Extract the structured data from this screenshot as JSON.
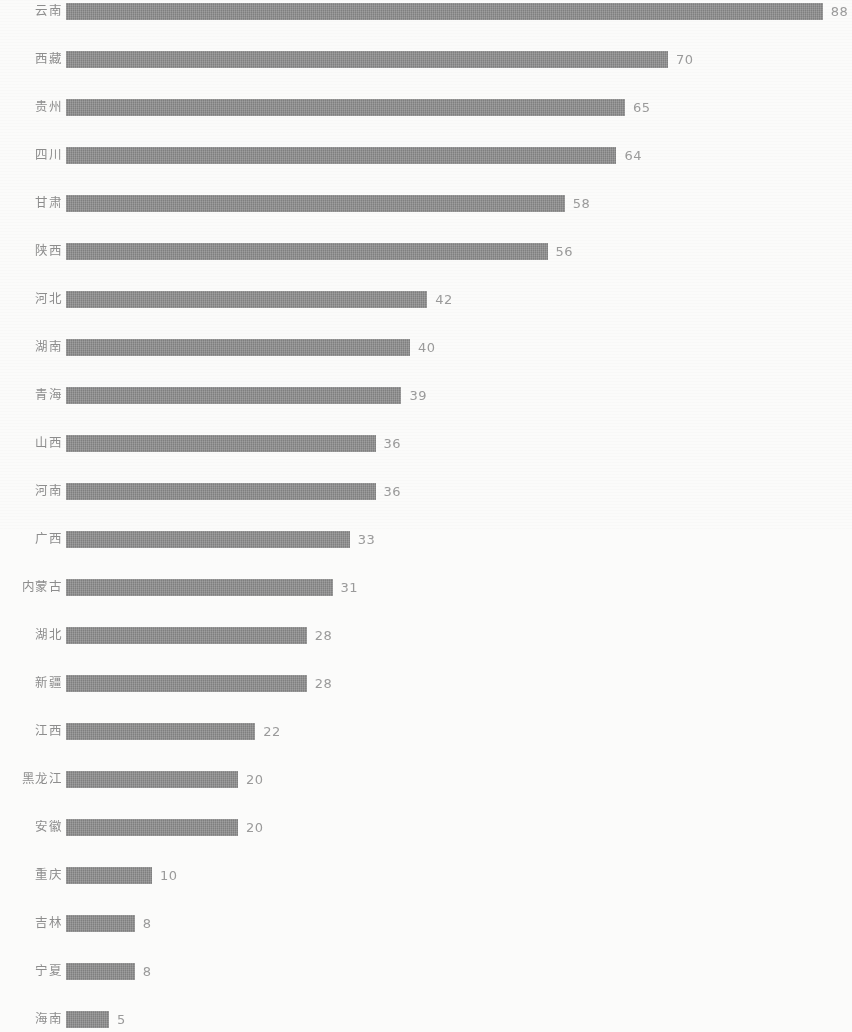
{
  "chart_data": {
    "type": "bar",
    "orientation": "horizontal",
    "title": "",
    "subtitle": "",
    "xlabel": "",
    "ylabel": "",
    "grid": false,
    "legend": null,
    "axis_visible": false,
    "xlim": [
      0,
      88
    ],
    "colors": {
      "bar": "#8b8b8b",
      "background": "#fbfbfa",
      "category_label": "#8d8d8d",
      "value_label": "#9a9a9a"
    },
    "categories": [
      "云南",
      "西藏",
      "贵州",
      "四川",
      "甘肃",
      "陕西",
      "河北",
      "湖南",
      "青海",
      "山西",
      "河南",
      "广西",
      "内蒙古",
      "湖北",
      "新疆",
      "江西",
      "黑龙江",
      "安徽",
      "重庆",
      "吉林",
      "宁夏",
      "海南"
    ],
    "values": [
      88,
      70,
      65,
      64,
      58,
      56,
      42,
      40,
      39,
      36,
      36,
      33,
      31,
      28,
      28,
      22,
      20,
      20,
      10,
      8,
      8,
      5
    ],
    "rows": [
      {
        "category": "云南",
        "value": 88,
        "value_label": "88"
      },
      {
        "category": "西藏",
        "value": 70,
        "value_label": "70"
      },
      {
        "category": "贵州",
        "value": 65,
        "value_label": "65"
      },
      {
        "category": "四川",
        "value": 64,
        "value_label": "64"
      },
      {
        "category": "甘肃",
        "value": 58,
        "value_label": "58"
      },
      {
        "category": "陕西",
        "value": 56,
        "value_label": "56"
      },
      {
        "category": "河北",
        "value": 42,
        "value_label": "42"
      },
      {
        "category": "湖南",
        "value": 40,
        "value_label": "40"
      },
      {
        "category": "青海",
        "value": 39,
        "value_label": "39"
      },
      {
        "category": "山西",
        "value": 36,
        "value_label": "36"
      },
      {
        "category": "河南",
        "value": 36,
        "value_label": "36"
      },
      {
        "category": "广西",
        "value": 33,
        "value_label": "33"
      },
      {
        "category": "内蒙古",
        "value": 31,
        "value_label": "31"
      },
      {
        "category": "湖北",
        "value": 28,
        "value_label": "28"
      },
      {
        "category": "新疆",
        "value": 28,
        "value_label": "28"
      },
      {
        "category": "江西",
        "value": 22,
        "value_label": "22"
      },
      {
        "category": "黑龙江",
        "value": 20,
        "value_label": "20"
      },
      {
        "category": "安徽",
        "value": 20,
        "value_label": "20"
      },
      {
        "category": "重庆",
        "value": 10,
        "value_label": "10"
      },
      {
        "category": "吉林",
        "value": 8,
        "value_label": "8"
      },
      {
        "category": "宁夏",
        "value": 8,
        "value_label": "8"
      },
      {
        "category": "海南",
        "value": 5,
        "value_label": "5"
      }
    ]
  },
  "layout": {
    "bar_origin_x": 66,
    "px_per_unit": 8.6,
    "row_height": 24,
    "bar_height": 17,
    "value_gap": 8
  }
}
